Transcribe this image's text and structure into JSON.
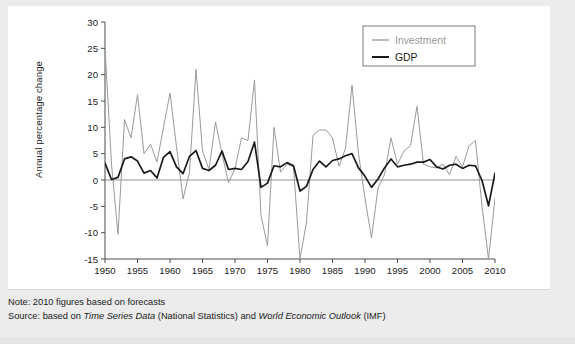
{
  "figure": {
    "ylabel": "Annual percentage change",
    "legend": {
      "position": "top-right",
      "items": [
        {
          "label": "Investment",
          "color": "#9a9a9a"
        },
        {
          "label": "GDP",
          "color": "#1a1a1a"
        }
      ]
    }
  },
  "notes": {
    "note_label": "Note:",
    "note_text": " 2010 figures based on forecasts",
    "source_label": "Source:",
    "source_pre": " based on ",
    "source_italic_1": "Time Series Data",
    "source_mid": " (National Statistics) and ",
    "source_italic_2": "World Economic Outlook",
    "source_post": " (IMF)"
  },
  "chart_data": {
    "type": "line",
    "title": "",
    "xlabel": "",
    "ylabel": "Annual percentage change",
    "xlim": [
      1950,
      2010
    ],
    "ylim": [
      -15,
      30
    ],
    "ytick_step": 5,
    "xtick_step": 5,
    "grid": false,
    "zero_line": true,
    "yticks": [
      -15,
      -10,
      -5,
      0,
      5,
      10,
      15,
      20,
      25,
      30
    ],
    "xticks": [
      1950,
      1955,
      1960,
      1965,
      1970,
      1975,
      1980,
      1985,
      1990,
      1995,
      2000,
      2005,
      2010
    ],
    "x": [
      1950,
      1951,
      1952,
      1953,
      1954,
      1955,
      1956,
      1957,
      1958,
      1959,
      1960,
      1961,
      1962,
      1963,
      1964,
      1965,
      1966,
      1967,
      1968,
      1969,
      1970,
      1971,
      1972,
      1973,
      1974,
      1975,
      1976,
      1977,
      1978,
      1979,
      1980,
      1981,
      1982,
      1983,
      1984,
      1985,
      1986,
      1987,
      1988,
      1989,
      1990,
      1991,
      1992,
      1993,
      1994,
      1995,
      1996,
      1997,
      1998,
      1999,
      2000,
      2001,
      2002,
      2003,
      2004,
      2005,
      2006,
      2007,
      2008,
      2009,
      2010
    ],
    "series": [
      {
        "name": "Investment",
        "color": "#9a9a9a",
        "linewidth": 1.0,
        "values": [
          25.2,
          3.0,
          -10.3,
          11.5,
          8.0,
          16.2,
          5.0,
          6.8,
          3.4,
          10.0,
          16.5,
          6.3,
          -3.6,
          1.5,
          21.0,
          5.5,
          2.0,
          11.0,
          5.0,
          -0.5,
          2.2,
          8.0,
          7.5,
          19.0,
          -6.8,
          -12.5,
          10.0,
          1.5,
          3.0,
          2.5,
          -15.0,
          -8.0,
          8.5,
          9.5,
          9.5,
          8.0,
          2.6,
          6.0,
          18.0,
          5.0,
          -3.5,
          -11.0,
          -1.5,
          1.0,
          8.0,
          3.0,
          5.5,
          6.5,
          14.0,
          3.0,
          2.5,
          2.3,
          3.0,
          1.0,
          4.5,
          2.5,
          6.5,
          7.5,
          -5.0,
          -15.0,
          -3.5
        ]
      },
      {
        "name": "GDP",
        "color": "#1a1a1a",
        "linewidth": 1.7,
        "values": [
          3.2,
          0.1,
          0.5,
          4.0,
          4.4,
          3.6,
          1.3,
          1.8,
          0.4,
          4.3,
          5.4,
          2.5,
          1.2,
          4.5,
          5.6,
          2.2,
          1.8,
          2.8,
          5.5,
          2.0,
          2.2,
          2.0,
          3.5,
          7.2,
          -1.4,
          -0.6,
          2.7,
          2.5,
          3.3,
          2.7,
          -2.1,
          -1.2,
          2.0,
          3.6,
          2.5,
          3.7,
          4.0,
          4.6,
          5.0,
          2.3,
          0.7,
          -1.4,
          0.2,
          2.3,
          4.0,
          2.5,
          2.8,
          3.0,
          3.4,
          3.4,
          3.9,
          2.5,
          2.1,
          2.8,
          3.0,
          2.2,
          2.8,
          2.7,
          -0.1,
          -4.9,
          1.3
        ]
      }
    ]
  }
}
